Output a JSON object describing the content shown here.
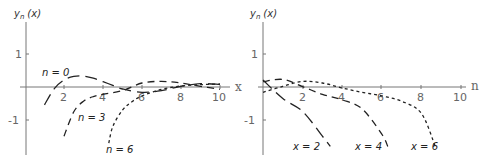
{
  "chart_data": [
    {
      "type": "line",
      "title": "",
      "ylabel": "y_n (x)",
      "xlabel": "x",
      "xlim": [
        0,
        10.5
      ],
      "ylim": [
        -1.8,
        1.8
      ],
      "xticks": [
        2,
        4,
        6,
        8,
        10
      ],
      "yticks": [
        1,
        -1
      ],
      "grid": false,
      "legend": "inline annotations",
      "series": [
        {
          "name": "n = 0",
          "dash": "long",
          "x": [
            1.0,
            1.5,
            2,
            2.5,
            3,
            3.5,
            4,
            4.5,
            5,
            6,
            7,
            8,
            9,
            10
          ],
          "values": [
            -0.54,
            -0.05,
            0.21,
            0.32,
            0.33,
            0.27,
            0.16,
            0.05,
            -0.06,
            -0.16,
            -0.11,
            0.02,
            0.1,
            0.08
          ]
        },
        {
          "name": "n = 3",
          "dash": "medium",
          "x": [
            2,
            2.5,
            3,
            3.5,
            4,
            5,
            6,
            7,
            8,
            9,
            10
          ],
          "values": [
            -1.49,
            -0.75,
            -0.43,
            -0.29,
            -0.22,
            -0.11,
            0.12,
            0.17,
            0.12,
            0.02,
            -0.07
          ]
        },
        {
          "name": "n = 6",
          "dash": "short",
          "x": [
            4.3,
            4.5,
            5,
            5.5,
            6,
            7,
            8,
            9,
            10
          ],
          "values": [
            -1.7,
            -1.2,
            -0.7,
            -0.44,
            -0.27,
            -0.07,
            0.03,
            0.07,
            0.09
          ]
        }
      ],
      "annotations": [
        "n = 0",
        "n = 3",
        "n = 6"
      ]
    },
    {
      "type": "line",
      "title": "",
      "ylabel": "y_n (x)",
      "xlabel": "n",
      "xlim": [
        0,
        10.5
      ],
      "ylim": [
        -1.8,
        1.8
      ],
      "xticks": [
        2,
        4,
        6,
        8,
        10
      ],
      "yticks": [
        1,
        -1
      ],
      "grid": false,
      "legend": "inline annotations",
      "series": [
        {
          "name": "x = 2",
          "dash": "long",
          "x": [
            0,
            1,
            2,
            3,
            3.4
          ],
          "values": [
            0.21,
            -0.35,
            -0.74,
            -1.49,
            -1.8
          ]
        },
        {
          "name": "x = 4",
          "dash": "medium",
          "x": [
            0,
            1,
            2,
            3,
            4,
            5,
            6,
            6.3
          ],
          "values": [
            0.16,
            0.23,
            0.01,
            -0.22,
            -0.39,
            -0.66,
            -1.43,
            -1.8
          ]
        },
        {
          "name": "x = 6",
          "dash": "short",
          "x": [
            0,
            1,
            2,
            3,
            4,
            5,
            6,
            7,
            8,
            8.7
          ],
          "values": [
            -0.16,
            0.02,
            0.17,
            0.12,
            -0.03,
            -0.16,
            -0.27,
            -0.43,
            -0.8,
            -1.8
          ]
        }
      ],
      "annotations": [
        "x = 2",
        "x = 4",
        "x = 6"
      ]
    }
  ],
  "left": {
    "ylabel_main": "y",
    "ylabel_sub": "n",
    "ylabel_arg": "(x)",
    "xaxis_label": "x",
    "xticks": [
      "2",
      "4",
      "6",
      "8",
      "10"
    ],
    "yticks": [
      "1",
      "-1"
    ],
    "labels": {
      "n0": "n = 0",
      "n3": "n = 3",
      "n6": "n = 6"
    }
  },
  "right": {
    "ylabel_main": "y",
    "ylabel_sub": "n",
    "ylabel_arg": "(x)",
    "xaxis_label": "n",
    "xticks": [
      "2",
      "4",
      "6",
      "8",
      "10"
    ],
    "yticks": [
      "1",
      "-1"
    ],
    "labels": {
      "x2": "x = 2",
      "x4": "x = 4",
      "x6": "x = 6"
    }
  },
  "colors": {
    "axis": "#777777",
    "curve": "#222222",
    "text": "#333333"
  }
}
